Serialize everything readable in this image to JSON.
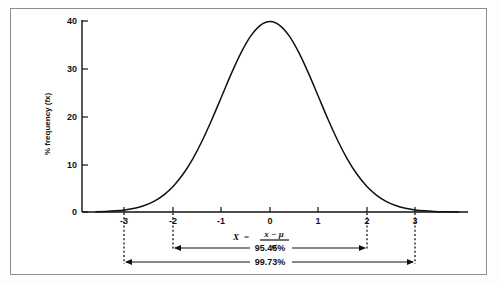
{
  "figure": {
    "background_color": "#ffffff",
    "frame_color": "#8e8e8e",
    "ink_color": "#111111"
  },
  "axes": {
    "y_label": "% frequency (fx)",
    "y_ticks": [
      "0",
      "10",
      "20",
      "30",
      "40"
    ],
    "x_ticks": [
      "-3",
      "-2",
      "-1",
      "0",
      "1",
      "2",
      "3"
    ]
  },
  "formula": {
    "variable": "X",
    "equals": "=",
    "numerator": "x − μ",
    "denominator": "σ"
  },
  "spans": [
    {
      "label": "95.45%",
      "from": -2,
      "to": 2
    },
    {
      "label": "99.73%",
      "from": -3,
      "to": 3
    }
  ],
  "chart_data": {
    "type": "line",
    "title": "",
    "xlabel": "X = (x − μ) / σ",
    "ylabel": "% frequency (fx)",
    "xlim": [
      -3.6,
      3.9
    ],
    "ylim": [
      0,
      40
    ],
    "x_tick_values": [
      -3,
      -2,
      -1,
      0,
      1,
      2,
      3
    ],
    "x_tick_labels": [
      "-3",
      "-2",
      "-1",
      "0",
      "1",
      "2",
      "3"
    ],
    "y_tick_values": [
      0,
      10,
      20,
      30,
      40
    ],
    "y_tick_labels": [
      "0",
      "10",
      "20",
      "30",
      "40"
    ],
    "grid": false,
    "legend": null,
    "series": [
      {
        "name": "standard normal density (% frequency)",
        "x": [
          -3.6,
          -3.4,
          -3.2,
          -3.0,
          -2.8,
          -2.6,
          -2.4,
          -2.2,
          -2.0,
          -1.8,
          -1.6,
          -1.4,
          -1.2,
          -1.0,
          -0.8,
          -0.6,
          -0.4,
          -0.2,
          0.0,
          0.2,
          0.4,
          0.6,
          0.8,
          1.0,
          1.2,
          1.4,
          1.6,
          1.8,
          2.0,
          2.2,
          2.4,
          2.6,
          2.8,
          3.0,
          3.2,
          3.4,
          3.6,
          3.9
        ],
        "y": [
          0.06,
          0.12,
          0.24,
          0.44,
          0.79,
          1.36,
          2.24,
          3.55,
          5.4,
          7.9,
          11.09,
          14.97,
          19.42,
          24.2,
          28.97,
          33.32,
          36.83,
          39.1,
          39.89,
          39.1,
          36.83,
          33.32,
          28.97,
          24.2,
          19.42,
          14.97,
          11.09,
          7.9,
          5.4,
          3.55,
          2.24,
          1.36,
          0.79,
          0.44,
          0.24,
          0.12,
          0.06,
          0.02
        ]
      }
    ],
    "annotations": [
      {
        "text": "95.45%",
        "x_from": -2,
        "x_to": 2,
        "kind": "double-arrow-span"
      },
      {
        "text": "99.73%",
        "x_from": -3,
        "x_to": 3,
        "kind": "double-arrow-span"
      }
    ],
    "peak": {
      "x": 0,
      "y": 39.89
    }
  }
}
